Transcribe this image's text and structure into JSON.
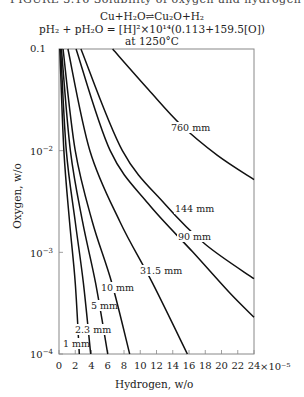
{
  "header_cutoff": "FIGURE 3.16  Solubility of oxygen and hydrogen in liquid copper",
  "title_lines": [
    "Cu+H₂O⇌Cu₂O+H₂",
    "pH₂ + pH₂O = [H]²×10¹⁴(0.113+159.5[O])",
    "at 1250°C"
  ],
  "chart_data": {
    "type": "line",
    "xlabel": "Hydrogen, w/o",
    "ylabel": "Oxygen, w/o",
    "x_multiplier": "×10⁻⁵",
    "xlim": [
      0,
      24
    ],
    "ylim": [
      0.0001,
      0.1
    ],
    "yscale": "log",
    "x_ticks": [
      0,
      2,
      4,
      6,
      8,
      10,
      12,
      14,
      16,
      18,
      20,
      22,
      24
    ],
    "x_tick_labels": [
      "0",
      "2",
      "4",
      "6",
      "8",
      "10",
      "12",
      "14",
      "16",
      "18",
      "20",
      "22",
      "24"
    ],
    "y_ticks": [
      0.1,
      0.01,
      0.001,
      0.0001
    ],
    "y_tick_labels": [
      "0.1",
      "10⁻²",
      "10⁻³",
      "10⁻⁴"
    ],
    "grid": false,
    "legend": "inline curve labels",
    "series": [
      {
        "name": "1 mm",
        "label": "1 mm",
        "points": [
          [
            0.1,
            0.1
          ],
          [
            0.6,
            0.01
          ],
          [
            1.3,
            0.002
          ],
          [
            2.0,
            0.0005
          ],
          [
            2.5,
            0.0001
          ]
        ]
      },
      {
        "name": "2.3 mm",
        "label": "2.3 mm",
        "points": [
          [
            0.2,
            0.1
          ],
          [
            0.9,
            0.01
          ],
          [
            2.0,
            0.002
          ],
          [
            3.0,
            0.0005
          ],
          [
            3.9,
            0.0001
          ]
        ]
      },
      {
        "name": "5 mm",
        "label": "5 mm",
        "points": [
          [
            0.3,
            0.1
          ],
          [
            1.4,
            0.01
          ],
          [
            2.9,
            0.002
          ],
          [
            4.5,
            0.0005
          ],
          [
            6.0,
            0.0001
          ]
        ]
      },
      {
        "name": "10 mm",
        "label": "10 mm",
        "points": [
          [
            0.5,
            0.1
          ],
          [
            2.0,
            0.01
          ],
          [
            4.1,
            0.002
          ],
          [
            6.5,
            0.0005
          ],
          [
            8.7,
            0.0001
          ]
        ]
      },
      {
        "name": "31.5 mm",
        "label": "31.5 mm",
        "points": [
          [
            1.1,
            0.1
          ],
          [
            3.8,
            0.01
          ],
          [
            7.5,
            0.002
          ],
          [
            11.5,
            0.0005
          ],
          [
            15.8,
            0.0001
          ]
        ]
      },
      {
        "name": "90 mm",
        "label": "90 mm",
        "points": [
          [
            2.1,
            0.1
          ],
          [
            6.3,
            0.01
          ],
          [
            11.0,
            0.003
          ],
          [
            16.5,
            0.001
          ],
          [
            21.0,
            0.0004
          ],
          [
            24.0,
            0.00023
          ]
        ]
      },
      {
        "name": "144 mm",
        "label": "144 mm",
        "points": [
          [
            2.7,
            0.1
          ],
          [
            7.8,
            0.01
          ],
          [
            13.0,
            0.003
          ],
          [
            18.0,
            0.0012
          ],
          [
            24.0,
            0.00055
          ]
        ]
      },
      {
        "name": "760 mm",
        "label": "760 mm",
        "points": [
          [
            6.6,
            0.1
          ],
          [
            11.0,
            0.04
          ],
          [
            15.0,
            0.018
          ],
          [
            19.5,
            0.009
          ],
          [
            24.0,
            0.0052
          ]
        ]
      }
    ]
  },
  "axis": {
    "xlabel": "Hydrogen, w/o",
    "ylabel": "Oxygen, w/o",
    "x_multiplier": "×10⁻⁵",
    "y_tick_labels": {
      "t0": "0.1",
      "t1": "10",
      "t1e": "−2",
      "t2": "10",
      "t2e": "−3",
      "t3": "10",
      "t3e": "−4"
    }
  }
}
